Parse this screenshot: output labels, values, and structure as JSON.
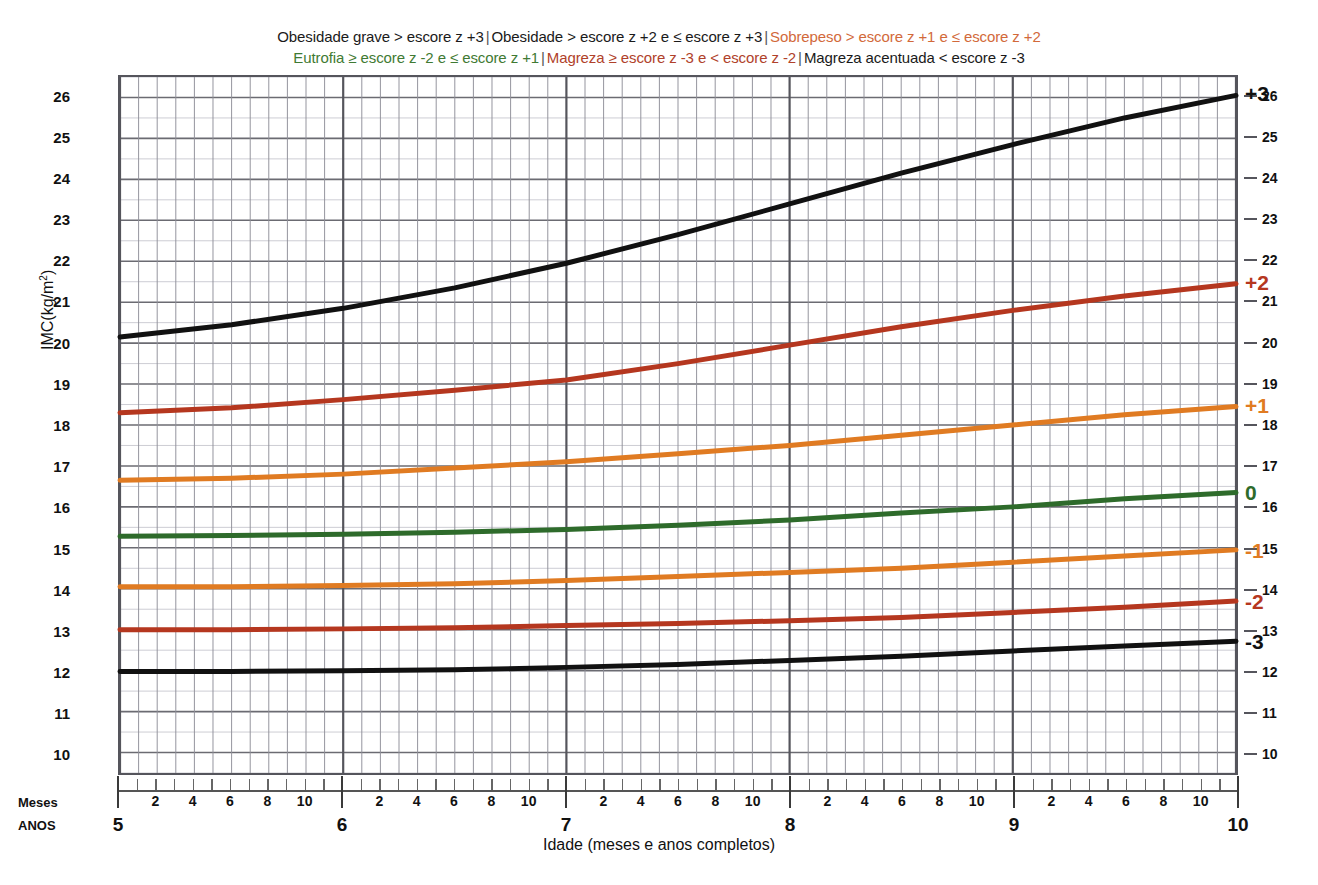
{
  "legend": {
    "line1": [
      {
        "text": "Obesidade grave > escore z +3",
        "color": "#1a1a1a"
      },
      {
        "text": "Obesidade  > escore z +2 e ≤ escore z +3",
        "color": "#1a1a1a"
      },
      {
        "text": "Sobrepeso > escore z +1 e ≤ escore z +2",
        "color": "#D2693A"
      }
    ],
    "line2": [
      {
        "text": "Eutrofia ≥ escore z -2 e ≤ escore z +1",
        "color": "#3F7A33"
      },
      {
        "text": "Magreza ≥ escore z -3 e < escore z -2",
        "color": "#B0412A"
      },
      {
        "text": "Magreza acentuada < escore z -3",
        "color": "#1a1a1a"
      }
    ],
    "separator": "|"
  },
  "chart_data": {
    "type": "line",
    "title": "",
    "xlabel": "Idade (meses e anos completos)",
    "ylabel": "IMC(kg/m²)",
    "xlim": [
      5,
      10
    ],
    "ylim": [
      9.5,
      26.5
    ],
    "grid": true,
    "x_unit": "anos",
    "x_minor_unit": "meses",
    "y_ticks": [
      26,
      25,
      24,
      23,
      22,
      21,
      20,
      19,
      18,
      17,
      16,
      15,
      14,
      13,
      12,
      11,
      10
    ],
    "y_ticks_right": [
      26,
      25,
      24,
      23,
      22,
      21,
      20,
      19,
      18,
      17,
      16,
      15,
      14,
      13,
      12,
      11,
      10
    ],
    "x_year_ticks": [
      5,
      6,
      7,
      8,
      9,
      10
    ],
    "x_month_ticks": [
      2,
      4,
      6,
      8,
      10
    ],
    "axis_row_labels": {
      "months": "Meses",
      "years": "ANOS"
    },
    "series": [
      {
        "name": "+3",
        "label": "+3",
        "color": "#111111",
        "width": 5,
        "x": [
          5.0,
          5.5,
          6.0,
          6.5,
          7.0,
          7.5,
          8.0,
          8.5,
          9.0,
          9.5,
          10.0
        ],
        "values": [
          20.15,
          20.45,
          20.85,
          21.35,
          21.95,
          22.65,
          23.4,
          24.15,
          24.85,
          25.5,
          26.05
        ]
      },
      {
        "name": "+2",
        "label": "+2",
        "color": "#B5371F",
        "width": 5,
        "x": [
          5.0,
          5.5,
          6.0,
          6.5,
          7.0,
          7.5,
          8.0,
          8.5,
          9.0,
          9.5,
          10.0
        ],
        "values": [
          18.3,
          18.42,
          18.62,
          18.85,
          19.1,
          19.5,
          19.95,
          20.4,
          20.8,
          21.15,
          21.45
        ]
      },
      {
        "name": "+1",
        "label": "+1",
        "color": "#E07B22",
        "width": 5,
        "x": [
          5.0,
          5.5,
          6.0,
          6.5,
          7.0,
          7.5,
          8.0,
          8.5,
          9.0,
          9.5,
          10.0
        ],
        "values": [
          16.65,
          16.7,
          16.8,
          16.95,
          17.1,
          17.3,
          17.5,
          17.75,
          18.0,
          18.25,
          18.45
        ]
      },
      {
        "name": "0",
        "label": "0",
        "color": "#2E6B2B",
        "width": 5,
        "x": [
          5.0,
          5.5,
          6.0,
          6.5,
          7.0,
          7.5,
          8.0,
          8.5,
          9.0,
          9.5,
          10.0
        ],
        "values": [
          15.28,
          15.3,
          15.33,
          15.38,
          15.45,
          15.55,
          15.68,
          15.85,
          16.0,
          16.2,
          16.35
        ]
      },
      {
        "name": "-1",
        "label": "-1",
        "color": "#E07B22",
        "width": 5,
        "x": [
          5.0,
          5.5,
          6.0,
          6.5,
          7.0,
          7.5,
          8.0,
          8.5,
          9.0,
          9.5,
          10.0
        ],
        "values": [
          14.05,
          14.05,
          14.08,
          14.12,
          14.2,
          14.3,
          14.4,
          14.5,
          14.65,
          14.8,
          14.95
        ]
      },
      {
        "name": "-2",
        "label": "-2",
        "color": "#B5371F",
        "width": 5,
        "x": [
          5.0,
          5.5,
          6.0,
          6.5,
          7.0,
          7.5,
          8.0,
          8.5,
          9.0,
          9.5,
          10.0
        ],
        "values": [
          13.0,
          13.0,
          13.02,
          13.05,
          13.1,
          13.15,
          13.22,
          13.3,
          13.42,
          13.55,
          13.7
        ]
      },
      {
        "name": "-3",
        "label": "-3",
        "color": "#111111",
        "width": 5,
        "x": [
          5.0,
          5.5,
          6.0,
          6.5,
          7.0,
          7.5,
          8.0,
          8.5,
          9.0,
          9.5,
          10.0
        ],
        "values": [
          11.98,
          11.98,
          12.0,
          12.02,
          12.08,
          12.15,
          12.25,
          12.35,
          12.48,
          12.6,
          12.72
        ]
      }
    ],
    "curve_labels": [
      {
        "text": "+3",
        "value": 26.05,
        "color": "#111111"
      },
      {
        "text": "+2",
        "value": 21.45,
        "color": "#B5371F"
      },
      {
        "text": "+1",
        "value": 18.45,
        "color": "#E07B22"
      },
      {
        "text": "0",
        "value": 16.35,
        "color": "#2E6B2B"
      },
      {
        "text": "-1",
        "value": 14.95,
        "color": "#E07B22"
      },
      {
        "text": "-2",
        "value": 13.7,
        "color": "#B5371F"
      },
      {
        "text": "-3",
        "value": 12.72,
        "color": "#111111"
      }
    ]
  }
}
